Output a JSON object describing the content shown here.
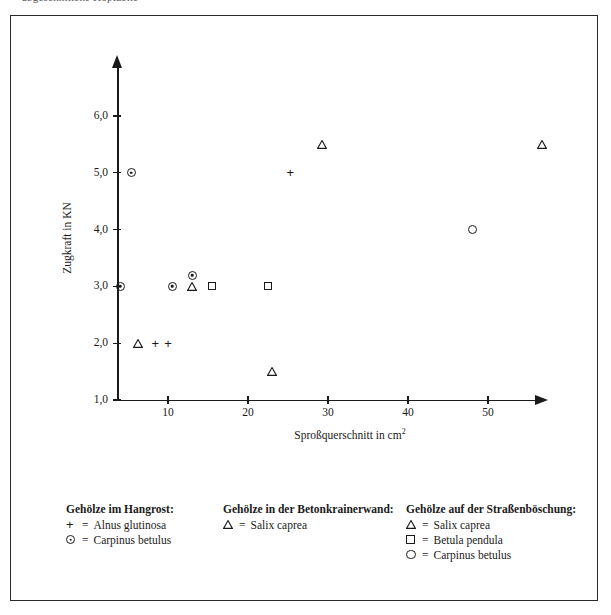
{
  "top_cut_text": "abgeschnittene Kopfzeile",
  "chart_data": {
    "type": "scatter",
    "title": "",
    "xlabel": "Sproßquerschnitt in cm",
    "xlabel_sup": "2",
    "ylabel": "Zugkraft in KN",
    "xlim": [
      3.6,
      56.5
    ],
    "ylim": [
      1.0,
      6.5
    ],
    "grid": false,
    "xticks": [
      10,
      20,
      30,
      40,
      50
    ],
    "xtick_labels": [
      "10",
      "20",
      "30",
      "40",
      "50"
    ],
    "yticks": [
      1.0,
      2.0,
      3.0,
      4.0,
      5.0,
      6.0
    ],
    "ytick_labels": [
      "1,0",
      "2,0",
      "3,0",
      "4,0",
      "5,0",
      "6,0"
    ],
    "series": [
      {
        "name": "Alnus glutinosa",
        "group": "Gehölze im Hangrost",
        "marker": "plus",
        "points": [
          {
            "x": 8.4,
            "y": 2.0
          },
          {
            "x": 10.0,
            "y": 2.0
          },
          {
            "x": 25.3,
            "y": 5.0
          }
        ]
      },
      {
        "name": "Carpinus betulus (Hangrost)",
        "group": "Gehölze im Hangrost",
        "marker": "circledot",
        "points": [
          {
            "x": 5.4,
            "y": 5.0
          },
          {
            "x": 4.0,
            "y": 3.0
          },
          {
            "x": 10.5,
            "y": 3.0
          },
          {
            "x": 13.0,
            "y": 3.2
          }
        ]
      },
      {
        "name": "Salix caprea (Betonkrainerwand)",
        "group": "Gehölze in der Betonkrainerwand",
        "marker": "triangle",
        "points": [
          {
            "x": 6.3,
            "y": 2.0
          },
          {
            "x": 13.0,
            "y": 3.0
          }
        ]
      },
      {
        "name": "Salix caprea (Straßenböschung)",
        "group": "Gehölze auf der Straßenböschung",
        "marker": "triangle",
        "points": [
          {
            "x": 29.3,
            "y": 5.5
          },
          {
            "x": 23.0,
            "y": 1.5
          },
          {
            "x": 56.8,
            "y": 5.5
          }
        ]
      },
      {
        "name": "Betula pendula",
        "group": "Gehölze auf der Straßenböschung",
        "marker": "square",
        "points": [
          {
            "x": 15.5,
            "y": 3.0
          },
          {
            "x": 22.5,
            "y": 3.0
          }
        ]
      },
      {
        "name": "Carpinus betulus (Straßenböschung)",
        "group": "Gehölze auf der Straßenböschung",
        "marker": "circle",
        "points": [
          {
            "x": 48.0,
            "y": 4.0
          }
        ]
      }
    ],
    "legend_position": "below-plot",
    "legend": [
      {
        "title": "Gehölze im Hangrost:",
        "entries": [
          {
            "symbol": "plus",
            "eq": "=",
            "label": "Alnus glutinosa"
          },
          {
            "symbol": "circledot",
            "eq": "=",
            "label": "Carpinus betulus"
          }
        ]
      },
      {
        "title": "Gehölze in der Betonkrainerwand:",
        "entries": [
          {
            "symbol": "triangle",
            "eq": "=",
            "label": "Salix caprea"
          }
        ]
      },
      {
        "title": "Gehölze auf der Straßenböschung:",
        "entries": [
          {
            "symbol": "triangle",
            "eq": "=",
            "label": "Salix caprea"
          },
          {
            "symbol": "square",
            "eq": "=",
            "label": "Betula pendula"
          },
          {
            "symbol": "circle",
            "eq": "=",
            "label": "Carpinus betulus"
          }
        ]
      }
    ]
  },
  "colors": {
    "ink": "#1a1a1a",
    "frame": "#2b2b2b",
    "background": "#ffffff"
  }
}
